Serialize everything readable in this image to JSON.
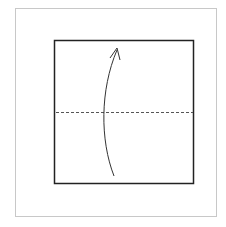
{
  "diagram": {
    "type": "origami-step",
    "fold_line": {
      "style": "dashed",
      "kind": "valley-fold",
      "position": "horizontal-center"
    },
    "arrow": {
      "direction": "up",
      "meaning": "fold bottom half up over top half"
    },
    "colors": {
      "frame": "#c8c8c8",
      "paper_edge": "#222222",
      "fold_line": "#555555",
      "arrow": "#333333"
    }
  }
}
